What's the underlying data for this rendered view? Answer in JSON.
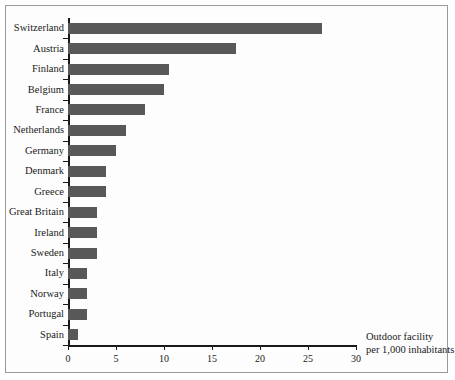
{
  "chart_data": {
    "type": "bar",
    "orientation": "horizontal",
    "title": "",
    "xlabel": "Outdoor facility per 1,000 inhabitants",
    "ylabel": "",
    "xlim": [
      0,
      30
    ],
    "xticks": [
      0,
      5,
      10,
      15,
      20,
      25,
      30
    ],
    "grid": false,
    "legend": null,
    "bar_color": "#585858",
    "categories": [
      "Switzerland",
      "Austria",
      "Finland",
      "Belgium",
      "France",
      "Netherlands",
      "Germany",
      "Denmark",
      "Greece",
      "Great Britain",
      "Ireland",
      "Sweden",
      "Italy",
      "Norway",
      "Portugal",
      "Spain"
    ],
    "values": [
      26.5,
      17.5,
      10.5,
      10,
      8,
      6,
      5,
      4,
      4,
      3,
      3,
      3,
      2,
      2,
      2,
      1
    ]
  },
  "caption": {
    "line1": "Outdoor facility",
    "line2": "per 1,000 inhabitants"
  }
}
